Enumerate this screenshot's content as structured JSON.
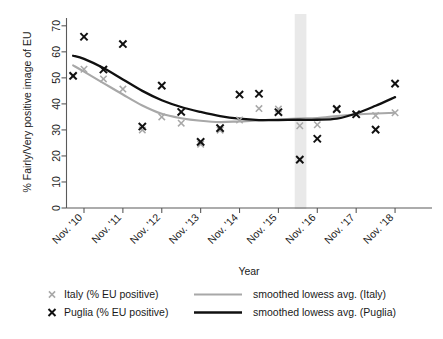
{
  "chart_data": {
    "type": "scatter",
    "title": "",
    "xlabel": "Year",
    "ylabel": "% Fairly/Very positive image of EU",
    "ylim": [
      0,
      73
    ],
    "yticks": [
      0,
      10,
      20,
      30,
      40,
      50,
      60,
      70
    ],
    "grid": false,
    "legend_position": "bottom",
    "xlim": [
      2009.55,
      2018.95
    ],
    "categories": [
      "Nov. '10",
      "Nov. '11",
      "Nov. '12",
      "Nov. '13",
      "Nov. '14",
      "Nov. '15",
      "Nov. '16",
      "Nov. '17",
      "Nov. '18"
    ],
    "xticks": [
      2010,
      2011,
      2012,
      2013,
      2014,
      2015,
      2016,
      2017,
      2018
    ],
    "highlight_band": {
      "label": "",
      "x_start": 2015.42,
      "x_end": 2015.72,
      "color": "#e9e9e9"
    },
    "series": [
      {
        "name": "Italy (% EU positive)",
        "marker": "x",
        "color": "#a8a8a8",
        "points": [
          {
            "x": 2009.72,
            "y": 50.5
          },
          {
            "x": 2010.0,
            "y": 53.3
          },
          {
            "x": 2010.5,
            "y": 49.6
          },
          {
            "x": 2011.0,
            "y": 45.7
          },
          {
            "x": 2011.5,
            "y": 30.0
          },
          {
            "x": 2012.0,
            "y": 35.0
          },
          {
            "x": 2012.5,
            "y": 32.6
          },
          {
            "x": 2013.0,
            "y": 24.5
          },
          {
            "x": 2013.5,
            "y": 29.9
          },
          {
            "x": 2014.0,
            "y": 33.8
          },
          {
            "x": 2014.5,
            "y": 38.2
          },
          {
            "x": 2015.0,
            "y": 38.0
          },
          {
            "x": 2015.55,
            "y": 31.6
          },
          {
            "x": 2016.0,
            "y": 32.0
          },
          {
            "x": 2016.5,
            "y": 38.3
          },
          {
            "x": 2017.0,
            "y": 36.0
          },
          {
            "x": 2017.5,
            "y": 35.5
          },
          {
            "x": 2018.0,
            "y": 36.6
          }
        ]
      },
      {
        "name": "Puglia (% EU positive)",
        "marker": "x",
        "color": "#101010",
        "points": [
          {
            "x": 2009.72,
            "y": 50.8
          },
          {
            "x": 2010.0,
            "y": 65.8
          },
          {
            "x": 2010.5,
            "y": 53.2
          },
          {
            "x": 2011.0,
            "y": 63.0
          },
          {
            "x": 2011.5,
            "y": 31.3
          },
          {
            "x": 2012.0,
            "y": 47.0
          },
          {
            "x": 2012.5,
            "y": 36.9
          },
          {
            "x": 2013.0,
            "y": 25.4
          },
          {
            "x": 2013.5,
            "y": 30.7
          },
          {
            "x": 2014.0,
            "y": 43.6
          },
          {
            "x": 2014.5,
            "y": 43.9
          },
          {
            "x": 2015.0,
            "y": 36.8
          },
          {
            "x": 2015.55,
            "y": 18.6
          },
          {
            "x": 2016.0,
            "y": 26.6
          },
          {
            "x": 2016.5,
            "y": 38.0
          },
          {
            "x": 2017.0,
            "y": 36.0
          },
          {
            "x": 2017.5,
            "y": 30.1
          },
          {
            "x": 2018.0,
            "y": 47.8
          }
        ]
      }
    ],
    "smoothed": [
      {
        "name": "smoothed lowess avg. (Italy)",
        "color": "#a8a8a8",
        "points": [
          {
            "x": 2009.72,
            "y": 54.8
          },
          {
            "x": 2010.0,
            "y": 52.4
          },
          {
            "x": 2010.5,
            "y": 48.0
          },
          {
            "x": 2011.0,
            "y": 43.6
          },
          {
            "x": 2011.5,
            "y": 39.4
          },
          {
            "x": 2012.0,
            "y": 36.2
          },
          {
            "x": 2012.5,
            "y": 34.5
          },
          {
            "x": 2013.0,
            "y": 33.5
          },
          {
            "x": 2013.5,
            "y": 33.0
          },
          {
            "x": 2014.0,
            "y": 33.3
          },
          {
            "x": 2014.5,
            "y": 33.6
          },
          {
            "x": 2015.0,
            "y": 34.1
          },
          {
            "x": 2015.5,
            "y": 34.4
          },
          {
            "x": 2016.0,
            "y": 34.6
          },
          {
            "x": 2016.5,
            "y": 35.3
          },
          {
            "x": 2017.0,
            "y": 35.9
          },
          {
            "x": 2017.5,
            "y": 36.3
          },
          {
            "x": 2018.0,
            "y": 36.6
          }
        ]
      },
      {
        "name": "smoothed lowess avg. (Puglia)",
        "color": "#101010",
        "points": [
          {
            "x": 2009.72,
            "y": 58.5
          },
          {
            "x": 2010.0,
            "y": 57.3
          },
          {
            "x": 2010.5,
            "y": 53.8
          },
          {
            "x": 2011.0,
            "y": 49.4
          },
          {
            "x": 2011.5,
            "y": 45.0
          },
          {
            "x": 2012.0,
            "y": 41.4
          },
          {
            "x": 2012.5,
            "y": 38.8
          },
          {
            "x": 2013.0,
            "y": 36.9
          },
          {
            "x": 2013.5,
            "y": 35.3
          },
          {
            "x": 2014.0,
            "y": 34.3
          },
          {
            "x": 2014.5,
            "y": 33.8
          },
          {
            "x": 2015.0,
            "y": 33.8
          },
          {
            "x": 2015.5,
            "y": 33.9
          },
          {
            "x": 2016.0,
            "y": 33.9
          },
          {
            "x": 2016.5,
            "y": 34.3
          },
          {
            "x": 2017.0,
            "y": 36.3
          },
          {
            "x": 2017.5,
            "y": 39.3
          },
          {
            "x": 2018.0,
            "y": 42.6
          }
        ]
      }
    ],
    "legend": [
      {
        "key": "italy-marker",
        "type": "marker",
        "label": "Italy (% EU positive)",
        "color": "#a8a8a8"
      },
      {
        "key": "puglia-marker",
        "type": "marker",
        "label": "Puglia (% EU positive)",
        "color": "#101010"
      },
      {
        "key": "italy-line",
        "type": "line",
        "label": "smoothed lowess avg. (Italy)",
        "color": "#a8a8a8"
      },
      {
        "key": "puglia-line",
        "type": "line",
        "label": "smoothed lowess avg. (Puglia)",
        "color": "#101010"
      }
    ]
  }
}
